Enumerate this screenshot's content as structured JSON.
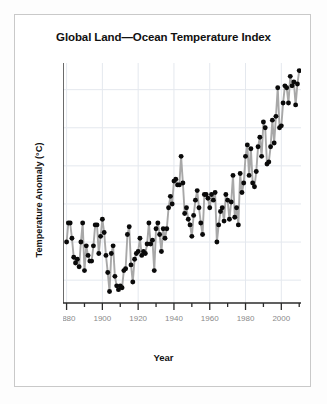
{
  "chart_data": {
    "type": "line",
    "title": "Global Land—Ocean Temperature Index",
    "xlabel": "Year",
    "ylabel": "Temperature Anomaly (°C)",
    "xlim": [
      1878,
      2011
    ],
    "ylim": [
      -0.52,
      0.74
    ],
    "grid": true,
    "legend": null,
    "x_major_ticks": [
      1880,
      1900,
      1920,
      1940,
      1960,
      1980,
      2000
    ],
    "x_major_tick_labels": [
      "1880",
      "1900",
      "1920",
      "1940",
      "1960",
      "1980",
      "2000"
    ],
    "x_minor_tick_step": 10,
    "y_ticks": [
      -0.4,
      -0.2,
      0.0,
      0.2,
      0.4,
      0.6
    ],
    "y_tick_labels": [
      "−0.4",
      "−0.2",
      "0.0",
      "0.2",
      "0.4",
      "0.6"
    ],
    "marker": "filled-circle",
    "marker_color": "#0a0a0a",
    "line_color": "#a8a8a8",
    "series": [
      {
        "name": "Global Land—Ocean Temperature Index",
        "x": [
          1880,
          1881,
          1882,
          1883,
          1884,
          1885,
          1886,
          1887,
          1888,
          1889,
          1890,
          1891,
          1892,
          1893,
          1894,
          1895,
          1896,
          1897,
          1898,
          1899,
          1900,
          1901,
          1902,
          1903,
          1904,
          1905,
          1906,
          1907,
          1908,
          1909,
          1910,
          1911,
          1912,
          1913,
          1914,
          1915,
          1916,
          1917,
          1918,
          1919,
          1920,
          1921,
          1922,
          1923,
          1924,
          1925,
          1926,
          1927,
          1928,
          1929,
          1930,
          1931,
          1932,
          1933,
          1934,
          1935,
          1936,
          1937,
          1938,
          1939,
          1940,
          1941,
          1942,
          1943,
          1944,
          1945,
          1946,
          1947,
          1948,
          1949,
          1950,
          1951,
          1952,
          1953,
          1954,
          1955,
          1956,
          1957,
          1958,
          1959,
          1960,
          1961,
          1962,
          1963,
          1964,
          1965,
          1966,
          1967,
          1968,
          1969,
          1970,
          1971,
          1972,
          1973,
          1974,
          1975,
          1976,
          1977,
          1978,
          1979,
          1980,
          1981,
          1982,
          1983,
          1984,
          1985,
          1986,
          1987,
          1988,
          1989,
          1990,
          1991,
          1992,
          1993,
          1994,
          1995,
          1996,
          1997,
          1998,
          1999,
          2000,
          2001,
          2002,
          2003,
          2004,
          2005,
          2006,
          2007,
          2008,
          2009,
          2010
        ],
        "values": [
          -0.2,
          -0.1,
          -0.1,
          -0.18,
          -0.28,
          -0.31,
          -0.29,
          -0.33,
          -0.2,
          -0.1,
          -0.35,
          -0.22,
          -0.27,
          -0.3,
          -0.3,
          -0.22,
          -0.11,
          -0.11,
          -0.26,
          -0.17,
          -0.08,
          -0.15,
          -0.27,
          -0.36,
          -0.46,
          -0.26,
          -0.22,
          -0.38,
          -0.43,
          -0.45,
          -0.43,
          -0.44,
          -0.35,
          -0.34,
          -0.16,
          -0.12,
          -0.32,
          -0.41,
          -0.29,
          -0.26,
          -0.25,
          -0.18,
          -0.27,
          -0.25,
          -0.26,
          -0.21,
          -0.1,
          -0.21,
          -0.19,
          -0.35,
          -0.13,
          -0.1,
          -0.16,
          -0.25,
          -0.13,
          -0.18,
          -0.13,
          -0.02,
          0.04,
          0.0,
          0.12,
          0.13,
          0.1,
          0.1,
          0.25,
          0.11,
          -0.05,
          -0.02,
          -0.08,
          -0.11,
          -0.17,
          -0.06,
          0.02,
          0.07,
          -0.02,
          -0.1,
          -0.16,
          0.05,
          0.05,
          0.03,
          -0.02,
          0.05,
          0.02,
          0.06,
          -0.2,
          -0.11,
          -0.04,
          -0.02,
          -0.09,
          0.05,
          0.02,
          -0.08,
          0.01,
          0.15,
          -0.07,
          -0.02,
          -0.11,
          0.16,
          0.06,
          0.11,
          0.25,
          0.31,
          0.15,
          0.29,
          0.11,
          0.09,
          0.17,
          0.3,
          0.35,
          0.25,
          0.43,
          0.4,
          0.21,
          0.22,
          0.3,
          0.44,
          0.32,
          0.46,
          0.61,
          0.4,
          0.41,
          0.53,
          0.62,
          0.61,
          0.53,
          0.67,
          0.62,
          0.64,
          0.52,
          0.63,
          0.7
        ]
      }
    ]
  }
}
